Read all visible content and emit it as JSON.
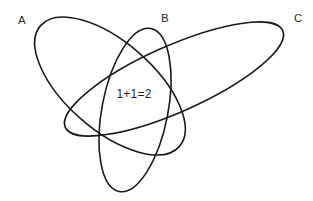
{
  "diagram": {
    "background_color": "#ffffff",
    "stroke_color": "#1a1a1a",
    "stroke_width": 1.6,
    "width": 313,
    "height": 201,
    "center_annotation": {
      "text": "1+1=2",
      "x": 134,
      "y": 98
    },
    "labels": [
      {
        "id": "A",
        "text": "A",
        "x": 18,
        "y": 24
      },
      {
        "id": "B",
        "text": "B",
        "x": 161,
        "y": 22
      },
      {
        "id": "C",
        "text": "C",
        "x": 294,
        "y": 22
      }
    ],
    "ellipses": [
      {
        "id": "A",
        "name": "ellipse-a",
        "cx": 110,
        "cy": 86,
        "rx": 92,
        "ry": 44,
        "rotation": 41
      },
      {
        "id": "B",
        "name": "ellipse-b",
        "cx": 135,
        "cy": 110,
        "rx": 83,
        "ry": 33,
        "rotation": 101
      },
      {
        "id": "C",
        "name": "ellipse-c",
        "cx": 174,
        "cy": 79,
        "rx": 119,
        "ry": 33,
        "rotation": -24
      }
    ]
  }
}
